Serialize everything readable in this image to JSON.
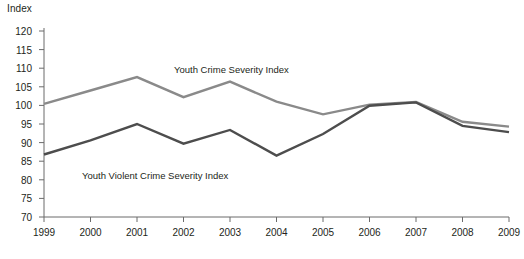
{
  "chart_data": {
    "type": "line",
    "title": "",
    "ylabel": "Index",
    "xlabel": "",
    "x": [
      1999,
      2000,
      2001,
      2002,
      2003,
      2004,
      2005,
      2006,
      2007,
      2008,
      2009
    ],
    "xtick_labels": [
      "1999",
      "2000",
      "2001",
      "2002",
      "2003",
      "2004",
      "2005",
      "2006",
      "2007",
      "2008",
      "2009"
    ],
    "ytick_labels": [
      "120",
      "115",
      "110",
      "105",
      "100",
      "95",
      "90",
      "85",
      "80",
      "75",
      "70"
    ],
    "yticks": [
      120,
      115,
      110,
      105,
      100,
      95,
      90,
      85,
      80,
      75,
      70
    ],
    "ylim": [
      70,
      120
    ],
    "grid": false,
    "legend_position": "inline-annotations",
    "series": [
      {
        "name": "Youth Crime Severity Index",
        "color": "#8a8a8a",
        "values": [
          100.4,
          104.0,
          107.6,
          102.2,
          106.4,
          101.0,
          97.6,
          100.2,
          100.9,
          95.6,
          94.3
        ]
      },
      {
        "name": "Youth Violent Crime Severity Index",
        "color": "#4d4d4d",
        "values": [
          86.8,
          90.6,
          95.0,
          89.7,
          93.4,
          86.5,
          92.3,
          99.9,
          100.8,
          94.5,
          92.8
        ]
      }
    ],
    "annotations": [
      {
        "text": "Youth Crime Severity Index",
        "x_px": 174,
        "y_px": 64
      },
      {
        "text": "Youth Violent Crime Severity Index",
        "x_px": 82,
        "y_px": 170
      }
    ]
  },
  "colors": {
    "axis": "#6b6b6b",
    "text": "#231f20",
    "background": "#ffffff",
    "series_light": "#8a8a8a",
    "series_dark": "#4d4d4d"
  }
}
